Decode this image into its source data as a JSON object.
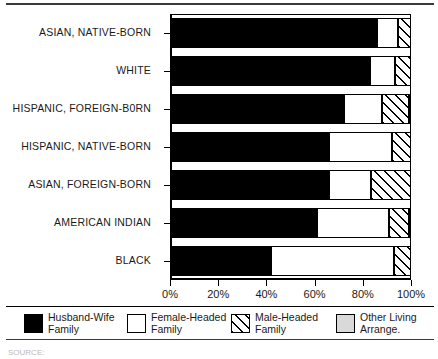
{
  "chart_data": {
    "type": "bar",
    "orientation": "horizontal",
    "stacked": true,
    "normalized": true,
    "title": "",
    "xlabel": "",
    "ylabel": "",
    "xlim": [
      0,
      100
    ],
    "xticks": [
      "0%",
      "20%",
      "40%",
      "60%",
      "80%",
      "100%"
    ],
    "xtick_values": [
      0,
      20,
      40,
      60,
      80,
      100
    ],
    "grid": false,
    "legend_position": "bottom",
    "categories": [
      "ASIAN, NATIVE-BORN",
      "WHITE",
      "HISPANIC, FOREIGN-B0RN",
      "HISPANIC, NATIVE-BORN",
      "ASIAN, FOREIGN-BORN",
      "AMERICAN INDIAN",
      "BLACK"
    ],
    "series": [
      {
        "name": "Husband-Wife Family",
        "legend_label": "Husband-Wife\nFamily",
        "pattern": "solid-black",
        "color": "#000000",
        "values": [
          86.0,
          83.0,
          72.0,
          66.0,
          66.0,
          61.0,
          42.0
        ]
      },
      {
        "name": "Female-Headed Family",
        "legend_label": "Female-Headed\nFamily",
        "pattern": "solid-white",
        "color": "#ffffff",
        "values": [
          8.5,
          10.5,
          16.0,
          26.0,
          17.5,
          30.0,
          51.0
        ]
      },
      {
        "name": "Male-Headed Family",
        "legend_label": "Male-Headed\nFamily",
        "pattern": "diagonal-hatch",
        "color": "#ffffff",
        "values": [
          5.5,
          6.5,
          11.0,
          8.0,
          16.5,
          8.5,
          7.0
        ]
      },
      {
        "name": "Other Living Arrange.",
        "legend_label": "Other Living\nArrange.",
        "pattern": "solid-gray",
        "color": "#d9d9d9",
        "values": [
          0.0,
          0.0,
          1.0,
          0.0,
          0.0,
          0.5,
          0.0
        ]
      }
    ]
  },
  "source_note": "SOURCE:"
}
